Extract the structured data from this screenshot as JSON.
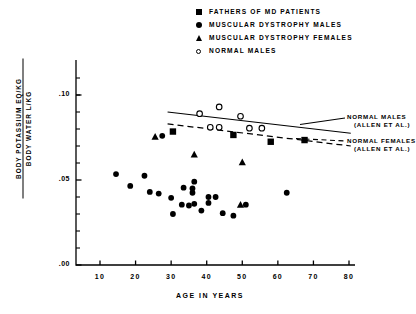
{
  "legend": {
    "items": [
      {
        "marker": "filled-square",
        "label": "FATHERS OF MD PATIENTS"
      },
      {
        "marker": "filled-circle",
        "label": "MUSCULAR DYSTROPHY MALES"
      },
      {
        "marker": "filled-triangle",
        "label": "MUSCULAR DYSTROPHY FEMALES"
      },
      {
        "marker": "open-circle",
        "label": "NORMAL MALES"
      }
    ]
  },
  "axes": {
    "y_label_numerator": "BODY POTASSIUM EQ/KG",
    "y_label_denominator": "BODY WATER L/KG",
    "x_label": "AGE IN YEARS",
    "y_ticks": [
      ".10",
      ".05",
      ".00"
    ],
    "x_ticks": [
      "10",
      "20",
      "30",
      "40",
      "50",
      "60",
      "70",
      "80"
    ]
  },
  "annotations": {
    "normal_males_line1": "NORMAL MALES",
    "normal_males_line2": "(ALLEN ET AL.)",
    "normal_females_line1": "NORMAL FEMALES",
    "normal_females_line2": "(ALLEN ET AL.)"
  },
  "chart_data": {
    "type": "scatter",
    "title": "",
    "xlabel": "AGE IN YEARS",
    "ylabel": "BODY POTASSIUM EQ/KG / BODY WATER L/KG",
    "xlim": [
      0,
      82
    ],
    "ylim": [
      0.0,
      0.115
    ],
    "xticks": [
      10,
      20,
      30,
      40,
      50,
      60,
      70,
      80
    ],
    "yticks": [
      0.0,
      0.05,
      0.1
    ],
    "ytick_labels": [
      ".00",
      ".05",
      ".10"
    ],
    "xtick_labels": [
      "10",
      "20",
      "30",
      "40",
      "50",
      "60",
      "70",
      "80"
    ],
    "grid": false,
    "legend_position": "top",
    "series": [
      {
        "name": "FATHERS OF MD PATIENTS",
        "marker": "filled-square",
        "points": [
          {
            "x": 30.5,
            "y": 0.0785
          },
          {
            "x": 47.5,
            "y": 0.0765
          },
          {
            "x": 58.0,
            "y": 0.0725
          },
          {
            "x": 67.5,
            "y": 0.0735
          }
        ]
      },
      {
        "name": "MUSCULAR DYSTROPHY MALES",
        "marker": "filled-circle",
        "points": [
          {
            "x": 27.5,
            "y": 0.076
          },
          {
            "x": 14.5,
            "y": 0.0535
          },
          {
            "x": 22.5,
            "y": 0.0525
          },
          {
            "x": 18.5,
            "y": 0.0465
          },
          {
            "x": 24.0,
            "y": 0.043
          },
          {
            "x": 26.5,
            "y": 0.042
          },
          {
            "x": 30.0,
            "y": 0.0395
          },
          {
            "x": 33.5,
            "y": 0.0455
          },
          {
            "x": 36.5,
            "y": 0.049
          },
          {
            "x": 36.0,
            "y": 0.045
          },
          {
            "x": 36.0,
            "y": 0.0425
          },
          {
            "x": 36.5,
            "y": 0.036
          },
          {
            "x": 38.5,
            "y": 0.032
          },
          {
            "x": 40.5,
            "y": 0.04
          },
          {
            "x": 40.5,
            "y": 0.0365
          },
          {
            "x": 42.5,
            "y": 0.04
          },
          {
            "x": 33.0,
            "y": 0.0355
          },
          {
            "x": 35.0,
            "y": 0.035
          },
          {
            "x": 30.5,
            "y": 0.03
          },
          {
            "x": 44.5,
            "y": 0.0305
          },
          {
            "x": 47.5,
            "y": 0.029
          },
          {
            "x": 51.0,
            "y": 0.0355
          },
          {
            "x": 62.5,
            "y": 0.0425
          }
        ]
      },
      {
        "name": "MUSCULAR DYSTROPHY FEMALES",
        "marker": "filled-triangle",
        "points": [
          {
            "x": 25.5,
            "y": 0.0755
          },
          {
            "x": 36.5,
            "y": 0.065
          },
          {
            "x": 50.0,
            "y": 0.0605
          },
          {
            "x": 49.5,
            "y": 0.0355
          }
        ]
      },
      {
        "name": "NORMAL MALES",
        "marker": "open-circle",
        "points": [
          {
            "x": 38.0,
            "y": 0.089
          },
          {
            "x": 43.5,
            "y": 0.093
          },
          {
            "x": 49.5,
            "y": 0.0875
          },
          {
            "x": 41.0,
            "y": 0.081
          },
          {
            "x": 43.5,
            "y": 0.081
          },
          {
            "x": 52.0,
            "y": 0.0805
          },
          {
            "x": 55.5,
            "y": 0.0805
          }
        ]
      }
    ],
    "lines": [
      {
        "name": "NORMAL MALES (ALLEN ET AL.)",
        "style": "solid",
        "x": [
          29.0,
          80.5
        ],
        "y": [
          0.09,
          0.0775
        ]
      },
      {
        "name": "NORMAL FEMALES (ALLEN ET AL.)",
        "style": "dashed",
        "x": [
          29.0,
          80.5
        ],
        "y": [
          0.083,
          0.07
        ]
      }
    ]
  }
}
